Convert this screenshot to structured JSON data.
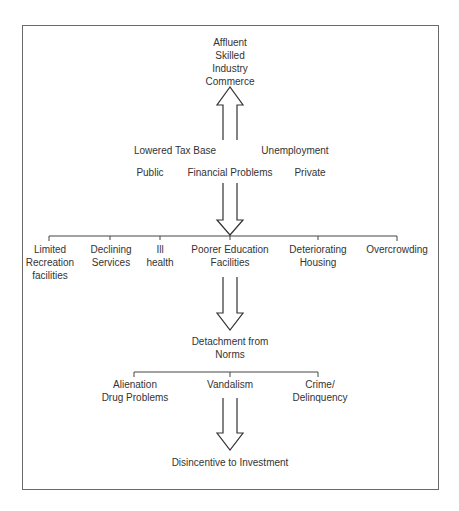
{
  "diagram": {
    "top_outcomes": [
      "Affluent",
      "Skilled",
      "Industry",
      "Commerce"
    ],
    "middle_labels": {
      "lowered_tax_base": "Lowered Tax Base",
      "unemployment": "Unemployment",
      "public": "Public",
      "financial_problems": "Financial Problems",
      "private": "Private"
    },
    "problems_row": [
      {
        "lines": [
          "Limited",
          "Recreation",
          "facilities"
        ]
      },
      {
        "lines": [
          "Declining",
          "Services"
        ]
      },
      {
        "lines": [
          "Ill",
          "health"
        ]
      },
      {
        "lines": [
          "Poorer Education",
          "Facilities"
        ]
      },
      {
        "lines": [
          "Deteriorating",
          "Housing"
        ]
      },
      {
        "lines": [
          "Overcrowding"
        ]
      }
    ],
    "detachment": [
      "Detachment from",
      "Norms"
    ],
    "consequences_row": [
      {
        "lines": [
          "Alienation",
          "Drug Problems"
        ]
      },
      {
        "lines": [
          "Vandalism"
        ]
      },
      {
        "lines": [
          "Crime/",
          "Delinquency"
        ]
      }
    ],
    "final_outcome": "Disincentive to Investment"
  }
}
